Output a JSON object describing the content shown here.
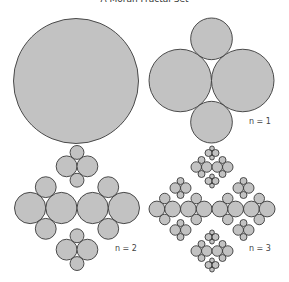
{
  "title": "A Moran Fractal Set",
  "panels": [
    {
      "id": "n0",
      "level": 0,
      "cx": 76,
      "cy": 81,
      "R": 62.5,
      "label": ""
    },
    {
      "id": "n1",
      "level": 1,
      "cx": 211.5,
      "cy": 80.5,
      "R": 62.5,
      "label": "n = 1",
      "label_x": 249,
      "label_y": 124
    },
    {
      "id": "n2",
      "level": 2,
      "cx": 77,
      "cy": 208,
      "R": 62.5,
      "label": "n = 2",
      "label_x": 115,
      "label_y": 251
    },
    {
      "id": "n3",
      "level": 3,
      "cx": 212,
      "cy": 209,
      "R": 63,
      "label": "n = 3",
      "label_x": 249,
      "label_y": 251
    }
  ],
  "chart_data": {
    "type": "diagram",
    "title": "A Moran Fractal Set",
    "rule": [
      {
        "dx": -0.5,
        "dy": 0,
        "r": 0.5
      },
      {
        "dx": 0.5,
        "dy": 0,
        "r": 0.5
      },
      {
        "dx": 0,
        "dy": -0.6667,
        "r": 0.3333
      },
      {
        "dx": 0,
        "dy": 0.6667,
        "r": 0.3333
      }
    ],
    "levels": [
      "n = 0 (single disc)",
      "n = 1",
      "n = 2",
      "n = 3"
    ],
    "circle_counts": [
      1,
      4,
      16,
      64
    ],
    "fill": "#c2c2c2",
    "stroke": "#3a3a3a"
  }
}
